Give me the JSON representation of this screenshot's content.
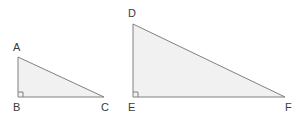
{
  "figure": {
    "background_color": "#ffffff",
    "stroke_color": "#808080",
    "fill_color": "#f1f1f1",
    "label_color": "#3b3b3b",
    "stroke_width": 1,
    "width": 306,
    "height": 128,
    "shapes": [
      {
        "name": "triangle-abc",
        "kind": "right-triangle",
        "vertices": [
          {
            "label": "A",
            "x": 18,
            "y": 57
          },
          {
            "label": "B",
            "x": 18,
            "y": 97
          },
          {
            "label": "C",
            "x": 104,
            "y": 97
          }
        ],
        "right_angle_at": "B",
        "points_attr": "18,57 18,97 104,97",
        "right_angle_marker": "23,97 23,92 18,92",
        "legs": {
          "vertical": 40,
          "horizontal": 86
        }
      },
      {
        "name": "triangle-def",
        "kind": "right-triangle",
        "vertices": [
          {
            "label": "D",
            "x": 133,
            "y": 24
          },
          {
            "label": "E",
            "x": 133,
            "y": 97
          },
          {
            "label": "F",
            "x": 285,
            "y": 97
          }
        ],
        "right_angle_at": "E",
        "points_attr": "133,24 133,97 285,97",
        "right_angle_marker": "138,97 138,92 133,92",
        "legs": {
          "vertical": 73,
          "horizontal": 152
        }
      }
    ],
    "labels": [
      {
        "name": "vertex-label-a",
        "text": "A",
        "left": 13,
        "top": 42
      },
      {
        "name": "vertex-label-b",
        "text": "B",
        "left": 13,
        "top": 102
      },
      {
        "name": "vertex-label-c",
        "text": "C",
        "left": 101,
        "top": 102
      },
      {
        "name": "vertex-label-d",
        "text": "D",
        "left": 128,
        "top": 8
      },
      {
        "name": "vertex-label-e",
        "text": "E",
        "left": 128,
        "top": 102
      },
      {
        "name": "vertex-label-f",
        "text": "F",
        "left": 285,
        "top": 102
      }
    ]
  }
}
